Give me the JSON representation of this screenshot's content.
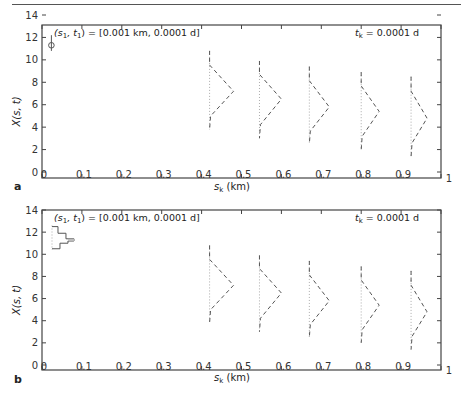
{
  "chart_data": [
    {
      "panel": "a",
      "type": "line",
      "title": "",
      "annotation_left": "(s1, t1) = [0.001 km, 0.0001 d]",
      "annotation_right": "tk = 0.0001 d",
      "xlabel": "sk (km)",
      "ylabel": "X(s, t)",
      "xlim": [
        0,
        1
      ],
      "ylim": [
        0,
        14
      ],
      "xticks": [
        "0",
        "0.1",
        "0.2",
        "0.3",
        "0.4",
        "0.5",
        "0.6",
        "0.7",
        "0.8",
        "0.9",
        "1"
      ],
      "yticks": [
        "0",
        "2",
        "4",
        "6",
        "8",
        "10",
        "12",
        "14"
      ],
      "grid": false,
      "initial_condition": {
        "s": 0.001,
        "mean": 11.3,
        "range": [
          10.8,
          12.2
        ],
        "style": "circle-with-bar"
      },
      "profiles": [
        {
          "s": 0.42,
          "mean": 7.2,
          "ymin": 3.8,
          "ymax": 10.8,
          "peak_offset": 0.06
        },
        {
          "s": 0.545,
          "mean": 6.5,
          "ymin": 3.0,
          "ymax": 9.9,
          "peak_offset": 0.055
        },
        {
          "s": 0.67,
          "mean": 5.8,
          "ymin": 2.5,
          "ymax": 9.4,
          "peak_offset": 0.05
        },
        {
          "s": 0.8,
          "mean": 5.4,
          "ymin": 2.0,
          "ymax": 8.9,
          "peak_offset": 0.045
        },
        {
          "s": 0.925,
          "mean": 4.8,
          "ymin": 1.4,
          "ymax": 8.5,
          "peak_offset": 0.04
        }
      ]
    },
    {
      "panel": "b",
      "type": "line",
      "title": "",
      "annotation_left": "(s1, t1) = [0.001 km, 0.0001 d]",
      "annotation_right": "tk = 0.0001 d",
      "xlabel": "sk (km)",
      "ylabel": "X(s, t)",
      "xlim": [
        0,
        1
      ],
      "ylim": [
        0,
        14
      ],
      "xticks": [
        "0",
        "0.1",
        "0.2",
        "0.3",
        "0.4",
        "0.5",
        "0.6",
        "0.7",
        "0.8",
        "0.9",
        "1"
      ],
      "yticks": [
        "0",
        "2",
        "4",
        "6",
        "8",
        "10",
        "12",
        "14"
      ],
      "grid": false,
      "initial_condition": {
        "s": 0.001,
        "style": "step-histogram",
        "bins": [
          {
            "y0": 10.5,
            "y1": 11.0,
            "w": 0.04
          },
          {
            "y0": 11.0,
            "y1": 11.2,
            "w": 0.08
          },
          {
            "y0": 11.2,
            "y1": 11.4,
            "w": 0.11
          },
          {
            "y0": 11.4,
            "y1": 11.9,
            "w": 0.07
          },
          {
            "y0": 11.9,
            "y1": 12.5,
            "w": 0.03
          }
        ]
      },
      "profiles": [
        {
          "s": 0.42,
          "mean": 7.2,
          "ymin": 3.8,
          "ymax": 10.8,
          "peak_offset": 0.06
        },
        {
          "s": 0.545,
          "mean": 6.5,
          "ymin": 3.0,
          "ymax": 9.9,
          "peak_offset": 0.055
        },
        {
          "s": 0.67,
          "mean": 5.8,
          "ymin": 2.5,
          "ymax": 9.4,
          "peak_offset": 0.05
        },
        {
          "s": 0.8,
          "mean": 5.4,
          "ymin": 2.0,
          "ymax": 8.9,
          "peak_offset": 0.045
        },
        {
          "s": 0.925,
          "mean": 4.8,
          "ymin": 1.4,
          "ymax": 8.5,
          "peak_offset": 0.04
        }
      ]
    }
  ],
  "panels": {
    "a": {
      "letter": "a",
      "annotation_left": "(s",
      "annotation_left_sub1": "1",
      "annotation_left_mid": ", t",
      "annotation_left_sub2": "1",
      "annotation_left_end": ") = [0.001 km, 0.0001 d]",
      "annotation_right_t": "t",
      "annotation_right_sub": "k",
      "annotation_right_end": " = 0.0001 d",
      "xlabel_s": "s",
      "xlabel_sub": "k",
      "xlabel_end": " (km)",
      "ylabel": "X(s, t)"
    },
    "b": {
      "letter": "b",
      "annotation_left": "(s",
      "annotation_left_sub1": "1",
      "annotation_left_mid": ", t",
      "annotation_left_sub2": "1",
      "annotation_left_end": ") = [0.001 km, 0.0001 d]",
      "annotation_right_t": "t",
      "annotation_right_sub": "k",
      "annotation_right_end": " = 0.0001 d",
      "xlabel_s": "s",
      "xlabel_sub": "k",
      "xlabel_end": " (km)",
      "ylabel": "X(s, t)"
    }
  },
  "colors": {
    "axis": "#444444",
    "curve": "#555555",
    "mean_line": "#aaaaaa",
    "text": "#222222"
  }
}
